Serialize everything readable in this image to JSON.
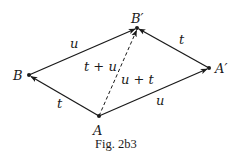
{
  "figure": {
    "caption": "Fig. 2b3",
    "points": [
      {
        "id": "A",
        "label": "A",
        "x": 99,
        "y": 116
      },
      {
        "id": "B",
        "label": "B",
        "x": 29,
        "y": 75
      },
      {
        "id": "A_prime",
        "label": "A′",
        "x": 209,
        "y": 68
      },
      {
        "id": "B_prime",
        "label": "B′",
        "x": 137,
        "y": 28
      }
    ],
    "edges": [
      {
        "from": "A",
        "to": "B",
        "label": "t",
        "style": "solid"
      },
      {
        "from": "B",
        "to": "B_prime",
        "label": "u",
        "style": "solid"
      },
      {
        "from": "A",
        "to": "A_prime",
        "label": "u",
        "style": "solid"
      },
      {
        "from": "A_prime",
        "to": "B_prime",
        "label": "t",
        "style": "solid"
      },
      {
        "from": "A",
        "to": "B_prime",
        "label_left": "t + u",
        "label_right": "u + t",
        "style": "dashed"
      }
    ],
    "labels": {
      "edge_AB": "t",
      "edge_BBp": "u",
      "edge_AAp": "u",
      "edge_ApBp": "t",
      "diag_left": "t + u",
      "diag_right": "u + t"
    }
  }
}
